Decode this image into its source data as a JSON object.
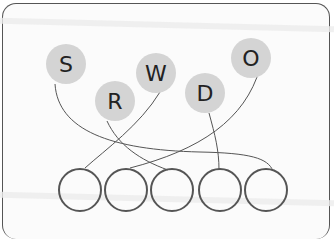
{
  "diagram": {
    "type": "letter-matching",
    "letters": [
      {
        "label": "S",
        "cx": 66,
        "cy": 64
      },
      {
        "label": "R",
        "cx": 115,
        "cy": 101
      },
      {
        "label": "W",
        "cx": 156,
        "cy": 73
      },
      {
        "label": "D",
        "cx": 205,
        "cy": 93
      },
      {
        "label": "O",
        "cx": 251,
        "cy": 58
      }
    ],
    "answer_circles": [
      {
        "index": 1,
        "cx": 80,
        "cy": 190
      },
      {
        "index": 2,
        "cx": 126,
        "cy": 190
      },
      {
        "index": 3,
        "cx": 172,
        "cy": 190
      },
      {
        "index": 4,
        "cx": 220,
        "cy": 190
      },
      {
        "index": 5,
        "cx": 266,
        "cy": 190
      }
    ],
    "connections": [
      {
        "from": "S",
        "to": 5
      },
      {
        "from": "R",
        "to": 3
      },
      {
        "from": "W",
        "to": 1
      },
      {
        "from": "D",
        "to": 4
      },
      {
        "from": "O",
        "to": 2
      }
    ],
    "colors": {
      "letter_fill": "#d4d4d4",
      "circle_stroke": "#555555",
      "line": "#555555"
    }
  }
}
